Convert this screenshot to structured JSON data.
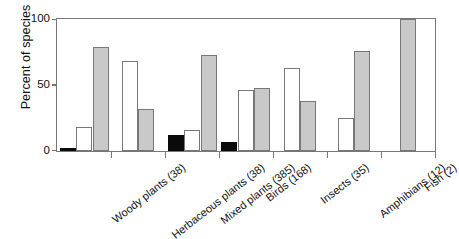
{
  "chart_data": {
    "type": "bar",
    "title": "",
    "xlabel": "",
    "ylabel": "Percent of species",
    "ylim": [
      0,
      100
    ],
    "yticks": [
      0,
      50,
      100
    ],
    "grid": false,
    "legend": "none",
    "categories": [
      "Woody plants (38)",
      "Herbaceous plants (38)",
      "Mixed plants (385)",
      "Birds (168)",
      "Insects (35)",
      "Amphibians (12)",
      "Fish (2)"
    ],
    "series": [
      {
        "name": "black",
        "values": [
          2,
          0,
          12,
          7,
          0,
          0,
          0
        ]
      },
      {
        "name": "white",
        "values": [
          18,
          68,
          16,
          46,
          63,
          25,
          0
        ]
      },
      {
        "name": "gray",
        "values": [
          79,
          32,
          73,
          48,
          38,
          76,
          100
        ]
      }
    ],
    "colors": {
      "black": "#0a0a0a",
      "white": "#ffffff",
      "gray": "#c9c9c9",
      "outline": "#777777",
      "text": "#111111"
    }
  }
}
